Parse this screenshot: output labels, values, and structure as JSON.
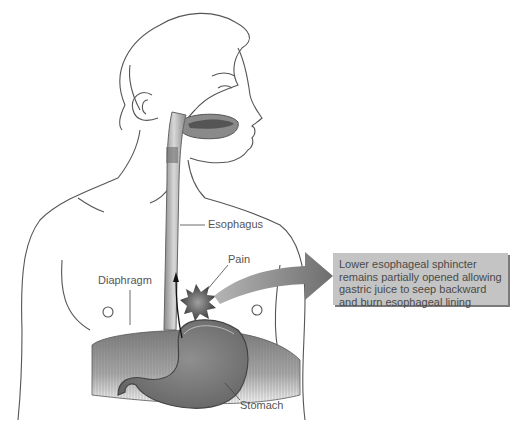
{
  "diagram": {
    "type": "anatomical illustration",
    "palette": {
      "line": "#555555",
      "organ_dark": "#6a6a6a",
      "organ_mid": "#9a9a9a",
      "organ_light": "#cfcfcf",
      "arrow": "#7d7d7d",
      "callout_bg": "#c4c4c4",
      "callout_shadow": "#7a7a7a"
    },
    "labels": {
      "esophagus": "Esophagus",
      "pain": "Pain",
      "diaphragm": "Diaphragm",
      "stomach": "Stomach"
    },
    "callout": {
      "lines": [
        "Lower esophageal sphincter",
        "remains partially opened allowing",
        "gastric juice to seep backward",
        "and burn esophageal lining"
      ]
    }
  }
}
